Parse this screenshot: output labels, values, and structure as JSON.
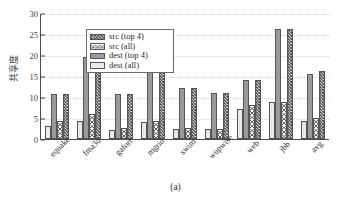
{
  "chart_data": {
    "type": "bar",
    "title": "",
    "subtitle": "",
    "xlabel": "",
    "ylabel": "共享度",
    "ylim": [
      0,
      30
    ],
    "yticks": [
      0,
      5,
      10,
      15,
      20,
      25,
      30
    ],
    "ytick_labels": [
      "0",
      "5",
      "10",
      "15",
      "20",
      "25",
      "30"
    ],
    "grid": true,
    "legend_position": "upper-left",
    "categories": [
      "equake",
      "fma3d",
      "gafort",
      "mgrid",
      "swim",
      "wupwise",
      "web",
      "jbb",
      "avg"
    ],
    "series": [
      {
        "name": "dest (all)",
        "fill": "light-gray-solid",
        "color": "#e9e9e9",
        "values": [
          3.2,
          4.4,
          2.1,
          4.1,
          2.4,
          2.3,
          7.2,
          8.7,
          4.2
        ]
      },
      {
        "name": "dest (top 4)",
        "fill": "dark-gray-solid",
        "color": "#9a9a9a",
        "values": [
          10.8,
          19.5,
          10.6,
          19.5,
          12.2,
          10.9,
          14.1,
          26.2,
          15.4
        ]
      },
      {
        "name": "src (all)",
        "fill": "diagonal-hatch",
        "color": "#4a4a4a",
        "values": [
          4.2,
          6.0,
          2.6,
          4.4,
          2.7,
          2.4,
          8.0,
          8.8,
          4.9
        ]
      },
      {
        "name": "src (top 4)",
        "fill": "crosshatch",
        "color": "#3f3f3f",
        "values": [
          10.8,
          19.5,
          10.6,
          26.2,
          12.2,
          10.9,
          14.1,
          26.2,
          16.3
        ]
      }
    ]
  },
  "legend": {
    "items": [
      {
        "label": "src (top 4)",
        "swatch": "crosshatch"
      },
      {
        "label": "src (all)",
        "swatch": "diagonal-hatch"
      },
      {
        "label": "dest (top 4)",
        "swatch": "dark-gray-solid"
      },
      {
        "label": "dest (all)",
        "swatch": "light-gray-solid"
      }
    ]
  },
  "caption": "(a)"
}
